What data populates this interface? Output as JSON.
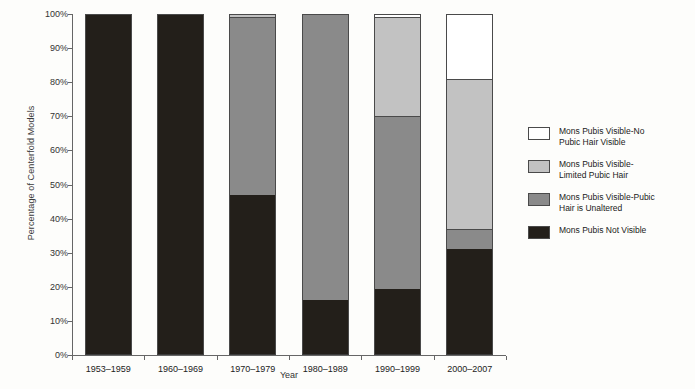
{
  "chart_data": {
    "type": "bar",
    "subtype": "stacked-bar-100-percent",
    "title": "",
    "xlabel": "Year",
    "ylabel": "Percentage of Centerfold Models",
    "categories": [
      "1953–1959",
      "1960–1969",
      "1970–1979",
      "1980–1989",
      "1990–1999",
      "2000–2007"
    ],
    "ylim": [
      0,
      100
    ],
    "yticks": [
      0,
      10,
      20,
      30,
      40,
      50,
      60,
      70,
      80,
      90,
      100
    ],
    "ytick_labels": [
      "0%",
      "10%",
      "20%",
      "30%",
      "40%",
      "50%",
      "60%",
      "70%",
      "80%",
      "90%",
      "100%"
    ],
    "grid": false,
    "legend_position": "right",
    "series": [
      {
        "name": "Mons Pubis Not Visible",
        "color": "#231f1a",
        "values": [
          100,
          100,
          47,
          16,
          19.5,
          31
        ]
      },
      {
        "name": "Mons Pubis Visible-Pubic Hair is Unaltered",
        "color": "#8a8a8a",
        "values": [
          0,
          0,
          52,
          84,
          50.5,
          6
        ]
      },
      {
        "name": "Mons Pubis Visible-Limited Pubic Hair",
        "color": "#c2c2c2",
        "values": [
          0,
          0,
          1,
          0,
          29,
          44
        ]
      },
      {
        "name": "Mons Pubis Visible-No Pubic Hair Visible",
        "color": "#ffffff",
        "values": [
          0,
          0,
          0,
          0,
          1,
          19
        ]
      }
    ]
  },
  "legend": {
    "items": [
      {
        "label": "Mons Pubis Visible-No\nPubic Hair Visible",
        "color": "#ffffff",
        "swatch_name": "swatch-no-pubic-hair"
      },
      {
        "label": "Mons Pubis Visible-\nLimited Pubic Hair",
        "color": "#c2c2c2",
        "swatch_name": "swatch-limited-pubic-hair"
      },
      {
        "label": "Mons Pubis Visible-Pubic\nHair is Unaltered",
        "color": "#8a8a8a",
        "swatch_name": "swatch-unaltered"
      },
      {
        "label": "Mons Pubis Not Visible",
        "color": "#231f1a",
        "swatch_name": "swatch-not-visible"
      }
    ]
  }
}
